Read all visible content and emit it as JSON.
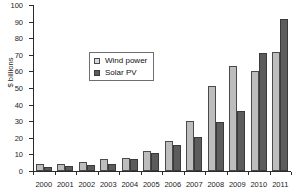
{
  "chart_data": {
    "type": "bar",
    "title": "",
    "xlabel": "",
    "ylabel": "$ billions",
    "ylim": [
      0,
      100
    ],
    "yticks": [
      0,
      10,
      20,
      30,
      40,
      50,
      60,
      70,
      80,
      90,
      100
    ],
    "grid": false,
    "legend_position": "upper left (inside plot area)",
    "categories": [
      "2000",
      "2001",
      "2002",
      "2003",
      "2004",
      "2005",
      "2006",
      "2007",
      "2008",
      "2009",
      "2010",
      "2011"
    ],
    "series": [
      {
        "name": "Wind power",
        "color": "#bdbdbd",
        "values": [
          4,
          4.5,
          5.5,
          7.5,
          8,
          11.8,
          17.8,
          30,
          51.5,
          63.5,
          60.5,
          71.5
        ]
      },
      {
        "name": "Solar PV",
        "color": "#5c5c5c",
        "values": [
          2.5,
          3,
          3.5,
          4.5,
          7,
          11,
          15.5,
          20.5,
          29.5,
          36,
          71,
          91.5
        ]
      }
    ]
  },
  "legend": {
    "items": [
      {
        "label": "Wind power",
        "swatch": "wind"
      },
      {
        "label": "Solar PV",
        "swatch": "solar"
      }
    ]
  }
}
